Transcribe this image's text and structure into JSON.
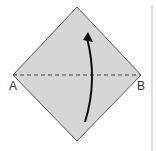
{
  "diagram": {
    "type": "origami-fold-step",
    "labels": {
      "left": "A",
      "right": "B"
    },
    "fold_line": "valley fold along A-B (dashed)",
    "arrow": "fold bottom half up over top",
    "colors": {
      "paper": "#d6d6d6",
      "edge": "#555555",
      "arrow": "#111111",
      "fold_line": "#444444"
    }
  }
}
